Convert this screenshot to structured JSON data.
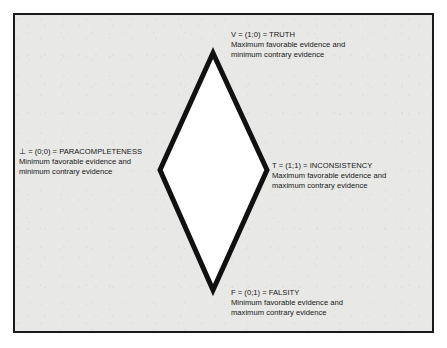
{
  "figure": {
    "type": "lattice-diagram",
    "shape": "diamond",
    "border_color": "#1a1a1a",
    "background_color": "#e8e8e6",
    "diamond_fill": "#ffffff",
    "diamond_stroke": "#111111",
    "vertices": {
      "top": {
        "x": 213,
        "y": 53
      },
      "right": {
        "x": 267,
        "y": 170
      },
      "bottom": {
        "x": 213,
        "y": 290
      },
      "left": {
        "x": 160,
        "y": 170
      }
    }
  },
  "labels": {
    "truth": {
      "heading": "V = (1;0) = TRUTH",
      "line1": "Maximum favorable evidence and",
      "line2": "minimum contrary evidence"
    },
    "inconsistency": {
      "heading": "T = (1;1) = INCONSISTENCY",
      "line1": "Maximum favorable evidence and",
      "line2": "maximum contrary evidence"
    },
    "paracompleteness": {
      "heading": "⊥ = (0;0) = PARACOMPLETENESS",
      "line1": "Minimum favorable evidence and",
      "line2": "minimum contrary evidence"
    },
    "falsity": {
      "heading": "F = (0;1) = FALSITY",
      "line1": "Minimum favorable evidence and",
      "line2": "maximum contrary evidence"
    }
  }
}
